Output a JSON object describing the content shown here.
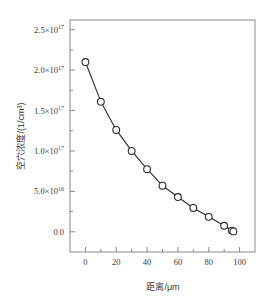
{
  "chart_data": {
    "type": "line",
    "title": "",
    "xlabel": "距离/μm",
    "ylabel": "空穴浓度/(1/cm³)",
    "xlim": [
      -10,
      110
    ],
    "ylim": [
      -2.5e+16,
      2.62e+17
    ],
    "grid": false,
    "legend": null,
    "marker": "open-circle",
    "x": [
      0,
      10,
      20,
      30,
      40,
      50,
      60,
      70,
      80,
      90,
      95,
      96
    ],
    "values": [
      2.1e+17,
      1.61e+17,
      1.26e+17,
      1e+17,
      7.75e+16,
      5.7e+16,
      4.3e+16,
      2.95e+16,
      1.85e+16,
      7500000000000000.0,
      1500000000000000.0,
      500000000000000.0
    ],
    "xticks": [
      0,
      20,
      40,
      60,
      80,
      100
    ],
    "xticklabels": [
      "0",
      "20",
      "40",
      "60",
      "80",
      "100"
    ],
    "xminorticks": [
      10,
      30,
      50,
      70,
      90
    ],
    "yticks": [
      0,
      5e+16,
      1e+17,
      1.5e+17,
      2e+17,
      2.5e+17
    ],
    "yticklabels": [
      {
        "mantissa": "0.0",
        "exp": ""
      },
      {
        "mantissa": "5.0×10",
        "exp": "16"
      },
      {
        "mantissa": "1.0×10",
        "exp": "17"
      },
      {
        "mantissa": "1.5×10",
        "exp": "17"
      },
      {
        "mantissa": "2.0×10",
        "exp": "17"
      },
      {
        "mantissa": "2.5×10",
        "exp": "17"
      }
    ],
    "yminorticks": [
      2.5e+16,
      7.5e+16,
      1.25e+17,
      1.75e+17,
      2.25e+17
    ],
    "line_color": "#2b2b2b",
    "marker_edge_color": "#2b2b2b",
    "marker_face_color": "#ffffff",
    "axes_color": "#888888",
    "background": "#ffffff"
  },
  "axis": {
    "y_title": "空穴浓度/(1/cm³)",
    "x_title": "距离/μm"
  }
}
